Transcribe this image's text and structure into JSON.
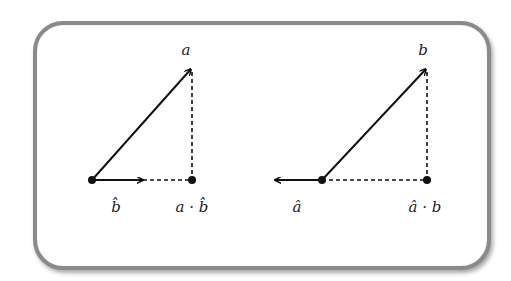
{
  "panels": [
    {
      "vector_label": "a",
      "unit_label": "b̂",
      "projection_label": "a · b̂",
      "unit_direction": "right"
    },
    {
      "vector_label": "b",
      "unit_label": "â",
      "projection_label": "â · b",
      "unit_direction": "left"
    }
  ],
  "colors": {
    "stroke": "#111111",
    "frame": "#8a8a8a"
  }
}
